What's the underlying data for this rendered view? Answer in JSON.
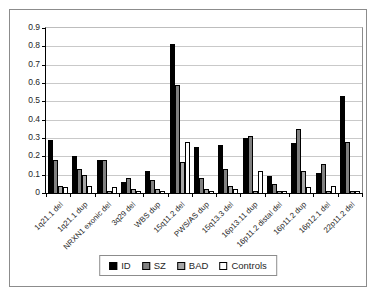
{
  "chart_data": {
    "type": "bar",
    "title": "",
    "xlabel": "",
    "ylabel": "",
    "ylim": [
      0,
      0.9
    ],
    "ytick_step": 0.1,
    "yticks": [
      "0.9",
      "0.8",
      "0.7",
      "0.6",
      "0.5",
      "0.4",
      "0.3",
      "0.2",
      "0.1",
      "0"
    ],
    "grid": true,
    "legend_position": "bottom",
    "categories": [
      "1q21.1 del",
      "1q21.1 dup",
      "NRXN1 exonic del",
      "3q29 del",
      "WBS dup",
      "15q11.2 del",
      "PWS/AS dup",
      "15q13.3 del",
      "16p13.11 dup",
      "16p11.2 distal del",
      "16p11.2 dup",
      "16p12.1 del",
      "22p11.2 del"
    ],
    "series": [
      {
        "name": "ID",
        "color": "#000000",
        "values": [
          0.29,
          0.2,
          0.18,
          0.06,
          0.12,
          0.81,
          0.25,
          0.26,
          0.3,
          0.09,
          0.27,
          0.11,
          0.53
        ]
      },
      {
        "name": "SZ",
        "color": "#808080",
        "values": [
          0.18,
          0.13,
          0.18,
          0.08,
          0.07,
          0.59,
          0.08,
          0.13,
          0.31,
          0.05,
          0.35,
          0.16,
          0.28
        ]
      },
      {
        "name": "BAD",
        "color": "#a6a6a6",
        "values": [
          0.04,
          0.1,
          0.01,
          0.02,
          0.02,
          0.17,
          0.02,
          0.04,
          0.01,
          0.01,
          0.12,
          0.01,
          0.01
        ]
      },
      {
        "name": "Controls",
        "color": "#ffffff",
        "values": [
          0.03,
          0.04,
          0.03,
          0.01,
          0.01,
          0.28,
          0.01,
          0.02,
          0.12,
          0.01,
          0.03,
          0.04,
          0.01
        ]
      }
    ],
    "colors": {
      "gridline": "#c9c9c9",
      "axis": "#000000",
      "text": "#262626",
      "outer_border": "#8c8c8c"
    }
  }
}
